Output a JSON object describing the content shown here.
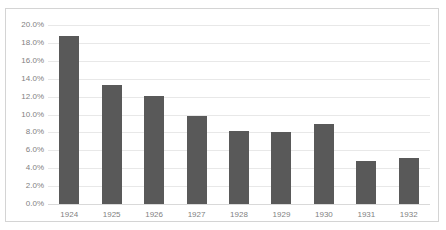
{
  "chart_data": {
    "type": "bar",
    "title": "",
    "subtitle": "",
    "xlabel": "",
    "ylabel": "",
    "categories": [
      "1924",
      "1925",
      "1926",
      "1927",
      "1928",
      "1929",
      "1930",
      "1931",
      "1932"
    ],
    "values": [
      18.8,
      13.3,
      12.1,
      9.8,
      8.2,
      8.0,
      8.9,
      4.8,
      5.1
    ],
    "value_labels": [
      "18.8%",
      "13.3%",
      "12.1%",
      "9.8%",
      "8.2%",
      "8.0%",
      "8.9%",
      "4.8%",
      "5.1%"
    ],
    "ylim": [
      0,
      20
    ],
    "ytick_values": [
      0,
      2,
      4,
      6,
      8,
      10,
      12,
      14,
      16,
      18,
      20
    ],
    "ytick_labels": [
      "0.0%",
      "2.0%",
      "4.0%",
      "6.0%",
      "8.0%",
      "10.0%",
      "12.0%",
      "14.0%",
      "16.0%",
      "18.0%",
      "20.0%"
    ],
    "grid": true,
    "legend": false,
    "legend_position": "none",
    "series": [
      {
        "name": "",
        "values": [
          18.8,
          13.3,
          12.1,
          9.8,
          8.2,
          8.0,
          8.9,
          4.8,
          5.1
        ]
      }
    ]
  },
  "style": {
    "bar_color": "#595959",
    "gridline_color": "#e8e8e8",
    "axis_color": "#d9d9d9",
    "tick_text_color": "#7f7f7f",
    "frame_border_color": "#d4d4d4",
    "background_color": "#ffffff"
  }
}
